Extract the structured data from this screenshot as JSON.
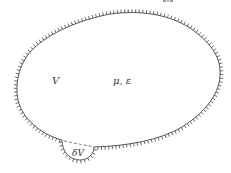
{
  "diagram": {
    "type": "region-boundary-sketch",
    "region": {
      "label": "V",
      "properties_label": "μ, ε",
      "boundary_style": "hatched-outward"
    },
    "subregion": {
      "label": "δV",
      "boundary_style": "hatched-outward",
      "chord_style": "dashed"
    },
    "colors": {
      "stroke": "#444444",
      "text": "#333333",
      "background": "#ffffff"
    }
  }
}
